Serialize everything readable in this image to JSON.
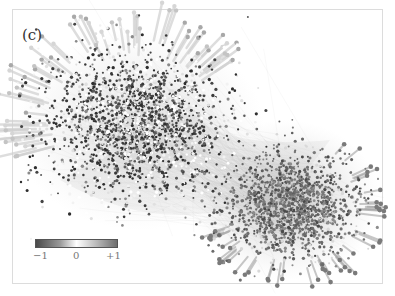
{
  "panel": {
    "label": "(c)"
  },
  "colorbar": {
    "min_label": "−1",
    "mid_label": "0",
    "max_label": "+1",
    "colors": [
      "#4a4a4a",
      "#ffffff",
      "#6e6e6e"
    ]
  },
  "chart_data": {
    "type": "scatter",
    "title": "(c)",
    "xlabel": "",
    "ylabel": "",
    "grid": false,
    "color_scale": {
      "min": -1,
      "max": 1,
      "ticks": [
        "−1",
        "0",
        "+1"
      ],
      "position": "lower-left"
    },
    "clusters": [
      {
        "name": "upper-left lobe",
        "center_px": [
          135,
          125
        ],
        "radius_px": [
          105,
          85
        ],
        "dominant_value": "mixed, many dark (≈−1) and light (≈0) points"
      },
      {
        "name": "lower-right lobe",
        "center_px": [
          290,
          205
        ],
        "radius_px": [
          75,
          60
        ],
        "dominant_value": "medium gray (≈+1)"
      }
    ]
  }
}
